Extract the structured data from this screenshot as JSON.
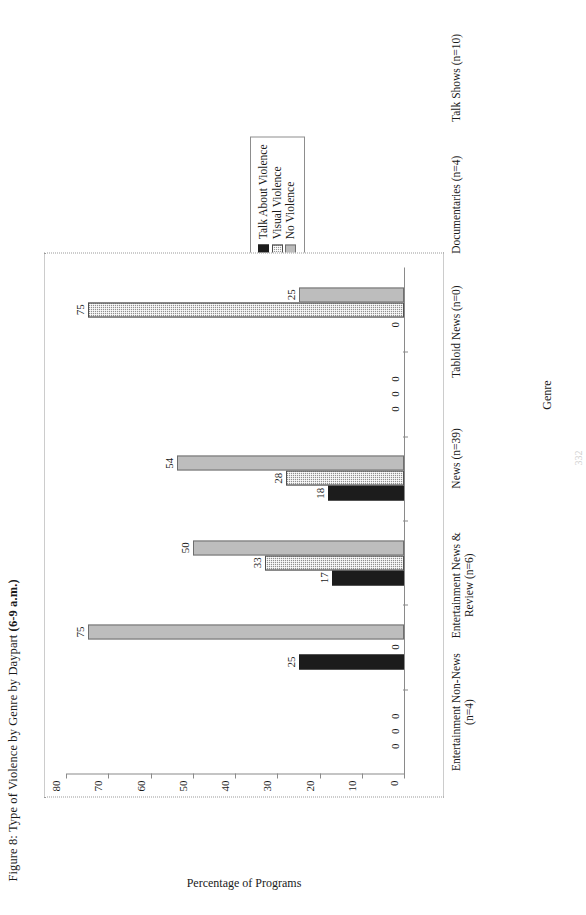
{
  "figure": {
    "title_prefix": "Figure 8: Type of Violence by Genre by Daypart ",
    "title_daypart": "(6-9 a.m.)",
    "title_full": "Figure 8: Type of Violence by Genre by Daypart (6-9 a.m.)"
  },
  "legend": {
    "position": "right",
    "items": [
      {
        "label": "Talk About Violence",
        "swatch": "black-solid-swatch",
        "color": "#1c1c1c"
      },
      {
        "label": "Visual Violence",
        "swatch": "gray-hatched-swatch",
        "color": "#8f8f8f"
      },
      {
        "label": "No Violence",
        "swatch": "light-gray-swatch",
        "color": "#bdbdbd"
      }
    ]
  },
  "axes": {
    "x_title": "Genre",
    "y_title": "Percentage of Programs",
    "y_ticks": [
      0,
      10,
      20,
      30,
      40,
      50,
      60,
      70,
      80
    ]
  },
  "chart_data": {
    "type": "bar",
    "title": "Figure 8: Type of Violence by Genre by Daypart (6-9 a.m.)",
    "xlabel": "Genre",
    "ylabel": "Percentage of Programs",
    "ylim": [
      0,
      80
    ],
    "ytick_step": 10,
    "grid": false,
    "legend_position": "right",
    "orientation": "vertical-grouped",
    "categories": [
      "Entertainment Non-News (n=4)",
      "Entertainment News & Review (n=6)",
      "News (n=39)",
      "Tabloid News (n=0)",
      "Documentaries (n=4)",
      "Talk Shows (n=10)"
    ],
    "series": [
      {
        "name": "Talk About Violence",
        "color": "#1c1c1c",
        "values": [
          0,
          25,
          17,
          18,
          0,
          0
        ]
      },
      {
        "name": "Visual Violence",
        "color": "#8f8f8f",
        "values": [
          0,
          0,
          33,
          28,
          0,
          75
        ]
      },
      {
        "name": "No Violence",
        "color": "#bdbdbd",
        "values": [
          0,
          75,
          50,
          54,
          0,
          25
        ]
      }
    ]
  },
  "page_number": "332"
}
